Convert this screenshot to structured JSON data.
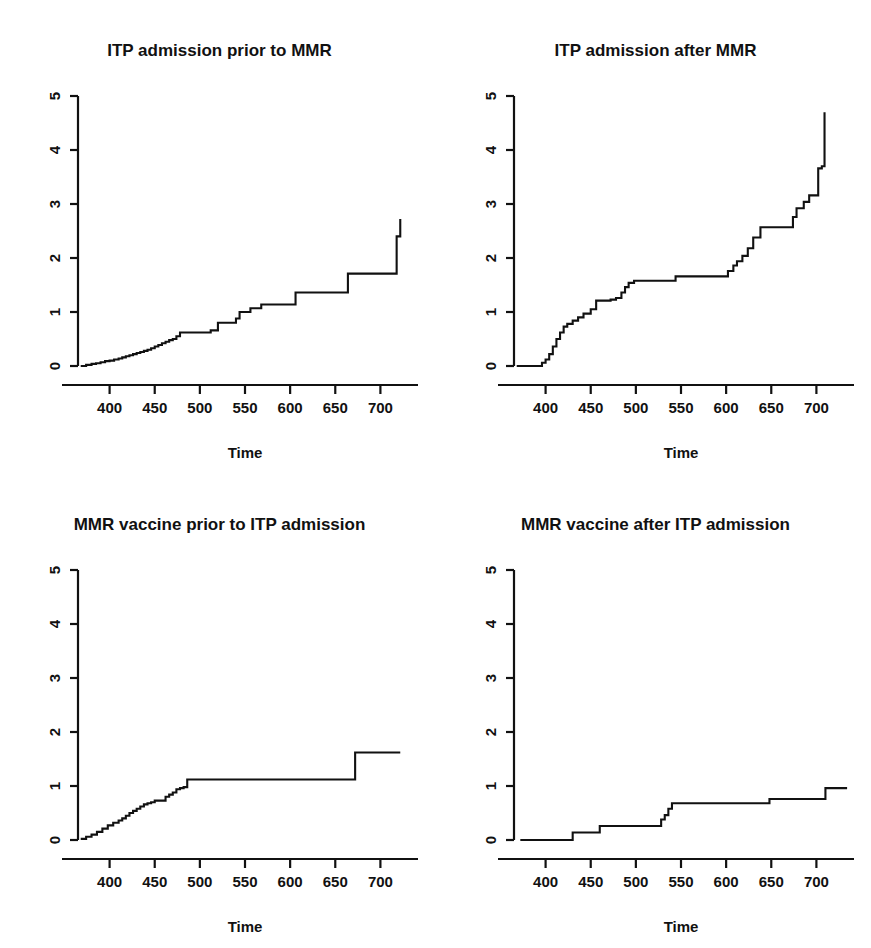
{
  "figure": {
    "background": "#ffffff",
    "ink": "#111111",
    "layout": "2x2 panel grid of step (cumulative hazard) curves"
  },
  "chart_data": [
    {
      "type": "line",
      "id": "itp-admission-prior-to-mmr",
      "title": "ITP admission prior to MMR",
      "xlabel": "Time",
      "ylabel": "",
      "xlim": [
        365,
        735
      ],
      "ylim": [
        0,
        5
      ],
      "xticks": [
        400,
        450,
        500,
        550,
        600,
        650,
        700
      ],
      "yticks": [
        0,
        1,
        2,
        3,
        4,
        5
      ],
      "xtick_labels": [
        "400",
        "450",
        "500",
        "550",
        "600",
        "650",
        "700"
      ],
      "ytick_labels": [
        "0",
        "1",
        "2",
        "3",
        "4",
        "5"
      ],
      "grid": false,
      "legend": null,
      "step_mode": "post",
      "x": [
        368,
        374,
        380,
        385,
        390,
        395,
        400,
        405,
        410,
        414,
        418,
        422,
        426,
        430,
        434,
        438,
        442,
        446,
        450,
        454,
        458,
        462,
        466,
        470,
        474,
        478,
        486,
        500,
        512,
        520,
        524,
        532,
        540,
        544,
        556,
        568,
        584,
        606,
        640,
        664,
        690,
        714,
        718,
        722
      ],
      "y": [
        0.0,
        0.02,
        0.04,
        0.05,
        0.07,
        0.09,
        0.1,
        0.12,
        0.14,
        0.16,
        0.18,
        0.2,
        0.22,
        0.24,
        0.26,
        0.28,
        0.3,
        0.33,
        0.36,
        0.39,
        0.42,
        0.45,
        0.48,
        0.5,
        0.55,
        0.62,
        0.62,
        0.62,
        0.66,
        0.8,
        0.8,
        0.8,
        0.88,
        1.0,
        1.07,
        1.14,
        1.14,
        1.36,
        1.36,
        1.71,
        1.71,
        1.71,
        2.4,
        2.72
      ]
    },
    {
      "type": "line",
      "id": "itp-admission-after-mmr",
      "title": "ITP admission after MMR",
      "xlabel": "Time",
      "ylabel": "",
      "xlim": [
        365,
        735
      ],
      "ylim": [
        0,
        5
      ],
      "xticks": [
        400,
        450,
        500,
        550,
        600,
        650,
        700
      ],
      "yticks": [
        0,
        1,
        2,
        3,
        4,
        5
      ],
      "xtick_labels": [
        "400",
        "450",
        "500",
        "550",
        "600",
        "650",
        "700"
      ],
      "ytick_labels": [
        "0",
        "1",
        "2",
        "3",
        "4",
        "5"
      ],
      "grid": false,
      "legend": null,
      "step_mode": "post",
      "x": [
        368,
        392,
        396,
        400,
        404,
        408,
        412,
        416,
        420,
        424,
        430,
        436,
        442,
        450,
        456,
        466,
        472,
        478,
        484,
        488,
        492,
        498,
        508,
        522,
        536,
        544,
        560,
        580,
        596,
        602,
        608,
        612,
        618,
        624,
        630,
        638,
        660,
        674,
        678,
        686,
        692,
        698,
        702,
        706,
        709
      ],
      "y": [
        0.0,
        0.0,
        0.06,
        0.12,
        0.22,
        0.36,
        0.5,
        0.62,
        0.73,
        0.78,
        0.84,
        0.9,
        0.97,
        1.05,
        1.21,
        1.21,
        1.23,
        1.26,
        1.36,
        1.46,
        1.54,
        1.58,
        1.58,
        1.58,
        1.58,
        1.66,
        1.66,
        1.66,
        1.66,
        1.76,
        1.86,
        1.94,
        2.04,
        2.18,
        2.38,
        2.57,
        2.57,
        2.76,
        2.92,
        3.04,
        3.16,
        3.16,
        3.66,
        3.7,
        4.7
      ]
    },
    {
      "type": "line",
      "id": "mmr-vaccine-prior-to-itp-admission",
      "title": "MMR vaccine prior to ITP admission",
      "xlabel": "Time",
      "ylabel": "",
      "xlim": [
        365,
        735
      ],
      "ylim": [
        0,
        5
      ],
      "xticks": [
        400,
        450,
        500,
        550,
        600,
        650,
        700
      ],
      "yticks": [
        0,
        1,
        2,
        3,
        4,
        5
      ],
      "xtick_labels": [
        "400",
        "450",
        "500",
        "550",
        "600",
        "650",
        "700"
      ],
      "ytick_labels": [
        "0",
        "1",
        "2",
        "3",
        "4",
        "5"
      ],
      "grid": false,
      "legend": null,
      "step_mode": "post",
      "x": [
        368,
        374,
        380,
        386,
        392,
        398,
        404,
        410,
        414,
        418,
        422,
        426,
        430,
        434,
        438,
        442,
        446,
        450,
        456,
        462,
        466,
        470,
        474,
        478,
        482,
        486,
        490,
        560,
        620,
        668,
        672,
        690,
        722
      ],
      "y": [
        0.02,
        0.06,
        0.1,
        0.15,
        0.21,
        0.27,
        0.32,
        0.36,
        0.4,
        0.45,
        0.5,
        0.54,
        0.58,
        0.62,
        0.66,
        0.68,
        0.7,
        0.73,
        0.73,
        0.8,
        0.84,
        0.88,
        0.94,
        0.96,
        0.98,
        1.12,
        1.12,
        1.12,
        1.12,
        1.12,
        1.62,
        1.62,
        1.62
      ]
    },
    {
      "type": "line",
      "id": "mmr-vaccine-after-itp-admission",
      "title": "MMR vaccine after ITP admission",
      "xlabel": "Time",
      "ylabel": "",
      "xlim": [
        365,
        735
      ],
      "ylim": [
        0,
        5
      ],
      "xticks": [
        400,
        450,
        500,
        550,
        600,
        650,
        700
      ],
      "yticks": [
        0,
        1,
        2,
        3,
        4,
        5
      ],
      "xtick_labels": [
        "400",
        "450",
        "500",
        "550",
        "600",
        "650",
        "700"
      ],
      "ytick_labels": [
        "0",
        "1",
        "2",
        "3",
        "4",
        "5"
      ],
      "grid": false,
      "legend": null,
      "step_mode": "post",
      "x": [
        372,
        426,
        430,
        456,
        460,
        524,
        528,
        532,
        536,
        540,
        644,
        648,
        706,
        710,
        734
      ],
      "y": [
        0.0,
        0.0,
        0.14,
        0.14,
        0.26,
        0.26,
        0.38,
        0.46,
        0.58,
        0.68,
        0.68,
        0.76,
        0.76,
        0.96,
        0.96
      ]
    }
  ],
  "panels": [
    {
      "title": "ITP admission prior to MMR",
      "xlabel": "Time"
    },
    {
      "title": "ITP admission after MMR",
      "xlabel": "Time"
    },
    {
      "title": "MMR vaccine prior to ITP admission",
      "xlabel": "Time"
    },
    {
      "title": "MMR vaccine after ITP admission",
      "xlabel": "Time"
    }
  ]
}
